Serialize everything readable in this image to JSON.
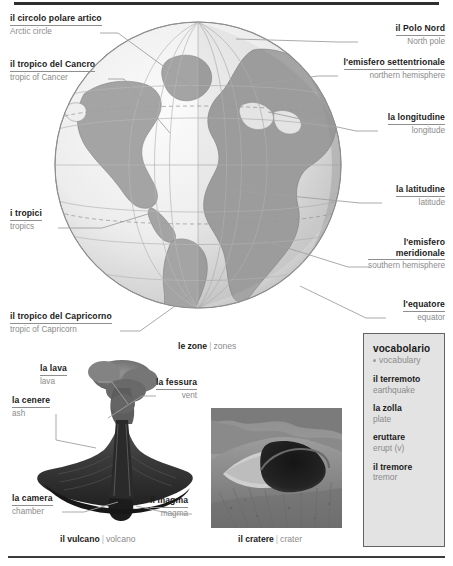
{
  "globe": {
    "caption": {
      "it": "le zone",
      "sep": "|",
      "en": "zones"
    },
    "labels": [
      {
        "name": "arctic-circle",
        "it": "il circolo polare artico",
        "en": "Arctic circle"
      },
      {
        "name": "tropic-of-cancer",
        "it": "il tropico del Cancro",
        "en": "tropic of Cancer"
      },
      {
        "name": "tropics",
        "it": "i tropici",
        "en": "tropics"
      },
      {
        "name": "tropic-of-capricorn",
        "it": "il tropico del Capricorno",
        "en": "tropic of Capricorn"
      },
      {
        "name": "north-pole",
        "it": "il Polo Nord",
        "en": "North pole"
      },
      {
        "name": "northern-hemisphere",
        "it": "l'emisfero settentrionale",
        "en": "northern hemisphere"
      },
      {
        "name": "longitude",
        "it": "la longitudine",
        "en": "longitude"
      },
      {
        "name": "latitude",
        "it": "la latitudine",
        "en": "latitude"
      },
      {
        "name": "southern-hemisphere",
        "it": "l'emisfero",
        "it2": "meridionale",
        "en": "southern hemisphere"
      },
      {
        "name": "equator",
        "it": "l'equatore",
        "en": "equator"
      }
    ]
  },
  "volcano": {
    "caption": {
      "it": "il vulcano",
      "sep": "|",
      "en": "volcano"
    },
    "labels": [
      {
        "name": "lava",
        "it": "la lava",
        "en": "lava"
      },
      {
        "name": "ash",
        "it": "la cenere",
        "en": "ash"
      },
      {
        "name": "vent",
        "it": "la fessura",
        "en": "vent"
      },
      {
        "name": "chamber",
        "it": "la camera",
        "en": "chamber"
      },
      {
        "name": "magma",
        "it": "il magma",
        "en": "magma"
      }
    ]
  },
  "crater": {
    "caption": {
      "it": "il cratere",
      "sep": "|",
      "en": "crater"
    }
  },
  "vocabulary": {
    "title": "vocabolario",
    "subtitle": "vocabulary",
    "items": [
      {
        "it": "il terremoto",
        "en": "earthquake"
      },
      {
        "it": "la zolla",
        "en": "plate"
      },
      {
        "it": "eruttare",
        "en": "erupt (v)"
      },
      {
        "it": "il tremore",
        "en": "tremor"
      }
    ]
  },
  "colors": {
    "rule": "#2e2e2e",
    "italian_text": "#1b1b1b",
    "english_text": "#8b8b8b",
    "leader_line": "#9a9a9a",
    "vocab_bg": "#e3e3e3",
    "vocab_border": "#636363",
    "ocean": "#ededed",
    "land": "#a8a8a8",
    "globe_shadow": "#c4c4c4"
  }
}
